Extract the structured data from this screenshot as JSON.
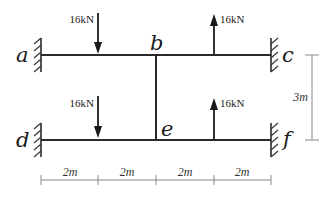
{
  "diagram": {
    "type": "structural-frame",
    "nodes": {
      "a": {
        "label": "a",
        "support": "fixed"
      },
      "b": {
        "label": "b"
      },
      "c": {
        "label": "c",
        "support": "fixed"
      },
      "d": {
        "label": "d",
        "support": "fixed"
      },
      "e": {
        "label": "e"
      },
      "f": {
        "label": "f",
        "support": "fixed"
      }
    },
    "members": [
      {
        "from": "a",
        "to": "c"
      },
      {
        "from": "d",
        "to": "f"
      },
      {
        "from": "b",
        "to": "e"
      }
    ],
    "loads": [
      {
        "label": "16kN",
        "direction": "down",
        "member": "a-b"
      },
      {
        "label": "16kN",
        "direction": "up",
        "member": "b-c"
      },
      {
        "label": "16kN",
        "direction": "down",
        "member": "d-e"
      },
      {
        "label": "16kN",
        "direction": "up",
        "member": "e-f"
      }
    ],
    "dimensions": {
      "horizontal": [
        "2m",
        "2m",
        "2m",
        "2m"
      ],
      "vertical": "3m"
    },
    "colors": {
      "member": "#2a2a2a",
      "dimension": "#888888",
      "text": "#1a1a1a"
    }
  }
}
